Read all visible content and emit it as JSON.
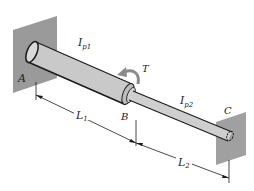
{
  "diagram": {
    "type": "stepped-shaft-torsion",
    "labels": {
      "A": "A",
      "B": "B",
      "C": "C",
      "T": "T",
      "Ip1_main": "I",
      "Ip1_sub": "p1",
      "Ip2_main": "I",
      "Ip2_sub": "p2",
      "L1_main": "L",
      "L1_sub": "1",
      "L2_main": "L",
      "L2_sub": "2"
    },
    "colors": {
      "wall": "#9a9a9a",
      "shaft": "#c9c9c9",
      "outline": "#1a1a1a",
      "arrow": "#8a8a8a"
    }
  }
}
